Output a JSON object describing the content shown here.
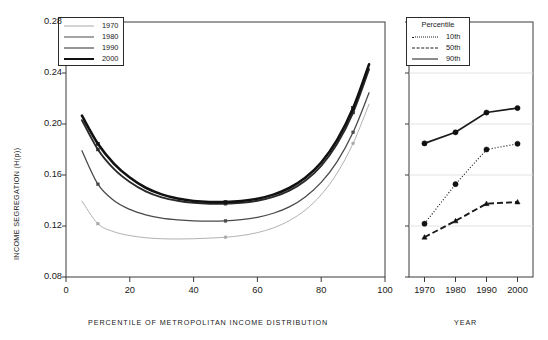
{
  "chart_data": [
    {
      "type": "line",
      "panel": "left",
      "title": "",
      "xlabel": "PERCENTILE OF METROPOLITAN INCOME DISTRIBUTION",
      "ylabel": "INCOME SEGREGATION (H(p))",
      "xlim": [
        0,
        100
      ],
      "ylim": [
        0.08,
        0.28
      ],
      "xticks": [
        0,
        20,
        40,
        60,
        80,
        100
      ],
      "yticks": [
        0.08,
        0.12,
        0.16,
        0.2,
        0.24,
        0.28
      ],
      "ytick_labels": [
        "0.08",
        "0.12",
        "0.16",
        "0.20",
        "0.24",
        "0.28"
      ],
      "xtick_labels": [
        "0",
        "20",
        "40",
        "60",
        "80",
        "100"
      ],
      "grid": false,
      "legend_position": "top-left",
      "legend_title": "",
      "x": [
        5,
        10,
        15,
        20,
        25,
        30,
        35,
        40,
        45,
        50,
        55,
        60,
        65,
        70,
        75,
        80,
        85,
        90,
        95
      ],
      "series": [
        {
          "name": "1970",
          "color": "#a8a8a8",
          "width": 0.9,
          "values": [
            0.1395,
            0.1218,
            0.1155,
            0.1125,
            0.1108,
            0.11,
            0.1098,
            0.11,
            0.1105,
            0.1112,
            0.1125,
            0.1148,
            0.1185,
            0.1242,
            0.1325,
            0.1445,
            0.1615,
            0.1848,
            0.2155
          ],
          "markers": [
            {
              "x": 10,
              "y": 0.1218
            },
            {
              "x": 50,
              "y": 0.1112
            },
            {
              "x": 90,
              "y": 0.1848
            }
          ]
        },
        {
          "name": "1980",
          "color": "#4a4a4a",
          "width": 1.3,
          "values": [
            0.179,
            0.1528,
            0.14,
            0.133,
            0.1288,
            0.1262,
            0.1248,
            0.124,
            0.1238,
            0.124,
            0.125,
            0.1268,
            0.13,
            0.135,
            0.1428,
            0.1542,
            0.1705,
            0.1935,
            0.2245
          ],
          "markers": [
            {
              "x": 10,
              "y": 0.1528
            },
            {
              "x": 50,
              "y": 0.124
            },
            {
              "x": 90,
              "y": 0.1935
            }
          ]
        },
        {
          "name": "1990",
          "color": "#2a2a2a",
          "width": 1.9,
          "values": [
            0.203,
            0.18,
            0.1648,
            0.1545,
            0.1472,
            0.1425,
            0.1398,
            0.1382,
            0.1375,
            0.1375,
            0.1382,
            0.1398,
            0.1428,
            0.1478,
            0.1555,
            0.1672,
            0.1845,
            0.209,
            0.243
          ],
          "markers": [
            {
              "x": 10,
              "y": 0.18
            },
            {
              "x": 50,
              "y": 0.1375
            },
            {
              "x": 90,
              "y": 0.209
            }
          ]
        },
        {
          "name": "2000",
          "color": "#111111",
          "width": 2.6,
          "values": [
            0.2065,
            0.1845,
            0.169,
            0.158,
            0.15,
            0.1448,
            0.1415,
            0.1396,
            0.1388,
            0.1388,
            0.1396,
            0.1414,
            0.1446,
            0.1498,
            0.1578,
            0.1698,
            0.1875,
            0.2125,
            0.2468
          ],
          "markers": [
            {
              "x": 10,
              "y": 0.1845
            },
            {
              "x": 50,
              "y": 0.1388
            },
            {
              "x": 90,
              "y": 0.2125
            }
          ]
        }
      ]
    },
    {
      "type": "line",
      "panel": "right",
      "title": "",
      "xlabel": "YEAR",
      "ylabel": "",
      "xlim": [
        1965,
        2005
      ],
      "ylim": [
        0.08,
        0.28
      ],
      "xticks": [
        1970,
        1980,
        1990,
        2000
      ],
      "xtick_labels": [
        "1970",
        "1980",
        "1990",
        "2000"
      ],
      "yticks": [
        0.08,
        0.12,
        0.16,
        0.2,
        0.24,
        0.28
      ],
      "grid": true,
      "legend_position": "top-left",
      "legend_title": "Percentile",
      "categories": [
        1970,
        1980,
        1990,
        2000
      ],
      "series": [
        {
          "name": "10th",
          "dash": "dotted",
          "color": "#1a1a1a",
          "marker": "circle",
          "values": [
            0.1218,
            0.1528,
            0.18,
            0.1845
          ]
        },
        {
          "name": "50th",
          "dash": "dashed",
          "color": "#1a1a1a",
          "marker": "triangle",
          "values": [
            0.1112,
            0.124,
            0.1375,
            0.1388
          ]
        },
        {
          "name": "90th",
          "dash": "solid",
          "color": "#1a1a1a",
          "marker": "circle",
          "values": [
            0.1848,
            0.1935,
            0.209,
            0.2125
          ]
        }
      ]
    }
  ],
  "left_panel": {
    "ylabel": "INCOME SEGREGATION (H(p))",
    "xlabel": "PERCENTILE OF METROPOLITAN INCOME DISTRIBUTION",
    "legend": {
      "title": "",
      "items": [
        {
          "label": "1970"
        },
        {
          "label": "1980"
        },
        {
          "label": "1990"
        },
        {
          "label": "2000"
        }
      ]
    },
    "xtick_labels": [
      "0",
      "20",
      "40",
      "60",
      "80",
      "100"
    ],
    "ytick_labels": [
      "0.08",
      "0.12",
      "0.16",
      "0.20",
      "0.24",
      "0.28"
    ]
  },
  "right_panel": {
    "xlabel": "YEAR",
    "legend": {
      "title": "Percentile",
      "items": [
        {
          "label": "10th"
        },
        {
          "label": "50th"
        },
        {
          "label": "90th"
        }
      ]
    },
    "xtick_labels": [
      "1970",
      "1980",
      "1990",
      "2000"
    ]
  }
}
